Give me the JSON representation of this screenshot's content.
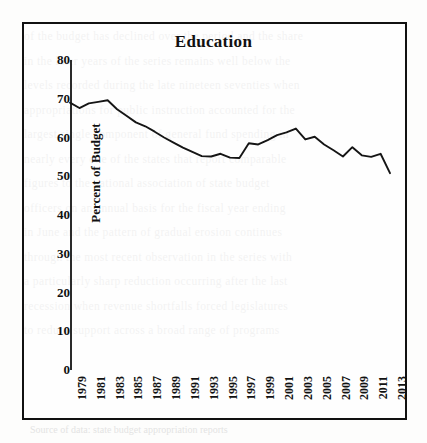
{
  "figure": {
    "title": "Education",
    "caption": "Source of data: state budget appropriation reports",
    "bleed_lines": [
      "of the budget has declined over the period and the share",
      "in the later years of the series remains well below the",
      "levels recorded during the late nineteen seventies when",
      "appropriations for public instruction accounted for the",
      "largest single component of general fund spending in",
      "nearly every one of the states that report comparable",
      "figures to the national association of state budget",
      "officers on an annual basis for the fiscal year ending",
      "in June and the pattern of gradual erosion continues",
      "through the most recent observation in the series with",
      "a particularly sharp reduction occurring after the last",
      "recession when revenue shortfalls forced legislatures",
      "to reduce support across a broad range of programs"
    ]
  },
  "chart_data": {
    "type": "line",
    "title": "Education",
    "xlabel": "",
    "ylabel": "Percent of Budget",
    "ylim": [
      0,
      80
    ],
    "yticks": [
      0,
      10,
      20,
      30,
      40,
      50,
      60,
      70,
      80
    ],
    "xlim": [
      1979,
      2013
    ],
    "xticks": [
      1979,
      1981,
      1983,
      1985,
      1987,
      1989,
      1991,
      1993,
      1995,
      1997,
      1999,
      2001,
      2003,
      2005,
      2007,
      2009,
      2011,
      2013
    ],
    "grid": false,
    "legend": null,
    "line_color": "#151515",
    "x": [
      1979,
      1980,
      1981,
      1982,
      1983,
      1984,
      1985,
      1986,
      1987,
      1988,
      1989,
      1990,
      1991,
      1992,
      1993,
      1994,
      1995,
      1996,
      1997,
      1998,
      1999,
      2000,
      2001,
      2002,
      2003,
      2004,
      2005,
      2006,
      2007,
      2008,
      2009,
      2010,
      2011,
      2012,
      2013
    ],
    "values": [
      69.0,
      67.6,
      68.8,
      69.2,
      69.6,
      67.3,
      65.6,
      63.9,
      62.9,
      61.5,
      60.0,
      58.7,
      57.4,
      56.3,
      55.2,
      55.1,
      55.8,
      54.8,
      54.7,
      58.5,
      58.2,
      59.3,
      60.6,
      61.3,
      62.3,
      59.5,
      60.2,
      58.2,
      56.7,
      55.1,
      57.5,
      55.4,
      55.0,
      55.8,
      50.8
    ],
    "series": [
      {
        "name": "Education",
        "values": [
          69.0,
          67.6,
          68.8,
          69.2,
          69.6,
          67.3,
          65.6,
          63.9,
          62.9,
          61.5,
          60.0,
          58.7,
          57.4,
          56.3,
          55.2,
          55.1,
          55.8,
          54.8,
          54.7,
          58.5,
          58.2,
          59.3,
          60.6,
          61.3,
          62.3,
          59.5,
          60.2,
          58.2,
          56.7,
          55.1,
          57.5,
          55.4,
          55.0,
          55.8,
          50.8
        ]
      }
    ]
  }
}
